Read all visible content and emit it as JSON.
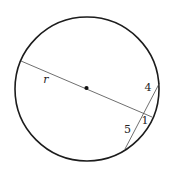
{
  "figure": {
    "type": "circle-intersecting-chords-diagram",
    "labels": {
      "radius": "r",
      "chord_upper_segment": "4",
      "line_outer_segment": "1",
      "chord_lower_segment": "5"
    },
    "colors": {
      "background": "#ffffff",
      "circle_stroke": "#1c1c1c",
      "line_stroke": "#4a4a4a",
      "center_dot": "#111111",
      "label_text": "#222222"
    }
  }
}
